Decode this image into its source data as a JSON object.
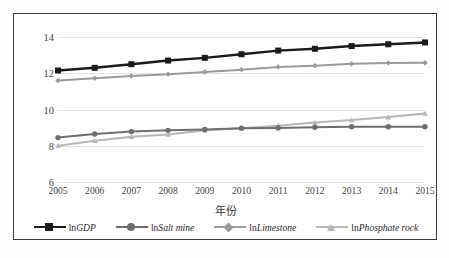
{
  "chart_data": {
    "type": "line",
    "title": "",
    "xlabel": "年份",
    "ylabel": "",
    "grid": true,
    "legend_position": "bottom",
    "categories": [
      "2005",
      "2006",
      "2007",
      "2008",
      "2009",
      "2010",
      "2011",
      "2012",
      "2013",
      "2014",
      "2015"
    ],
    "x": [
      2005,
      2006,
      2007,
      2008,
      2009,
      2010,
      2011,
      2012,
      2013,
      2014,
      2015
    ],
    "xlim": [
      2005,
      2015
    ],
    "ylim": [
      6,
      14
    ],
    "yticks": [
      6,
      8,
      10,
      12,
      14
    ],
    "series": [
      {
        "name": "lnGDP",
        "name_prefix": "ln",
        "name_italic": "GDP",
        "color": "#1a1a1a",
        "marker": "square",
        "values": [
          12.15,
          12.3,
          12.5,
          12.7,
          12.85,
          13.05,
          13.25,
          13.35,
          13.5,
          13.6,
          13.7
        ]
      },
      {
        "name": "lnSalt mine",
        "name_prefix": "ln",
        "name_italic": "Salt mine",
        "color": "#6e6e6e",
        "marker": "circle",
        "values": [
          8.45,
          8.65,
          8.78,
          8.85,
          8.9,
          8.97,
          8.98,
          9.02,
          9.05,
          9.05,
          9.05
        ]
      },
      {
        "name": "lnLimestone",
        "name_prefix": "ln",
        "name_italic": "Limestone",
        "color": "#9a9a9a",
        "marker": "diamond",
        "values": [
          11.6,
          11.72,
          11.85,
          11.95,
          12.07,
          12.2,
          12.35,
          12.42,
          12.52,
          12.57,
          12.58
        ]
      },
      {
        "name": "lnPhosphate rock",
        "name_prefix": "ln",
        "name_italic": "Phosphate rock",
        "color": "#b7b7b7",
        "marker": "triangle",
        "values": [
          8.0,
          8.28,
          8.5,
          8.62,
          8.85,
          8.97,
          9.1,
          9.28,
          9.42,
          9.58,
          9.78
        ]
      }
    ]
  },
  "colors": {
    "frame": "#3a3a3a",
    "grid": "#e3e3e3",
    "background": "#ffffff",
    "tick_text": "#444444"
  },
  "caption": ""
}
